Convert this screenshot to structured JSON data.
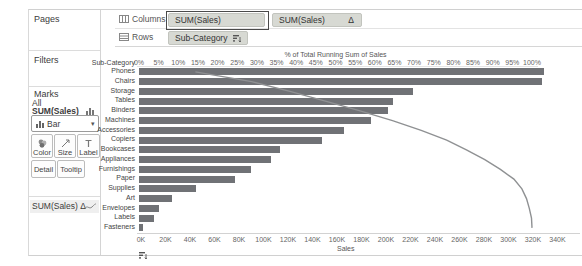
{
  "colors": {
    "bar": "#707276",
    "line": "#8f9193",
    "pill_bg": "#d7d9d3",
    "selected_pill_border": "#4a4a4a",
    "divider": "#d4d4d4"
  },
  "left_panel": {
    "pages_label": "Pages",
    "filters_label": "Filters",
    "marks_label": "Marks",
    "tab_all": "All",
    "tab_sales": "SUM(Sales)",
    "mark_type_label": "Bar",
    "color_label": "Color",
    "size_label": "Size",
    "label_label": "Label",
    "detail_label": "Detail",
    "tooltip_label": "Tooltip",
    "tab_sales_delta": "SUM(Sales) Δ"
  },
  "shelves": {
    "columns_label": "Columns",
    "rows_label": "Rows",
    "col_pill_1": "SUM(Sales)",
    "col_pill_2": "SUM(Sales)",
    "col_pill_2_suffix": "Δ",
    "row_pill_1": "Sub-Category"
  },
  "chart_data": {
    "type": "bar",
    "orientation": "horizontal",
    "top_axis_title": "% of Total Running Sum of Sales",
    "bottom_axis_title": "Sales",
    "row_header": "Sub-Category",
    "categories": [
      "Phones",
      "Chairs",
      "Storage",
      "Tables",
      "Binders",
      "Machines",
      "Accessories",
      "Copiers",
      "Bookcases",
      "Appliances",
      "Furnishings",
      "Paper",
      "Supplies",
      "Art",
      "Envelopes",
      "Labels",
      "Fasteners"
    ],
    "series": [
      {
        "name": "SUM(Sales)",
        "type": "bar",
        "axis": "bottom",
        "values": [
          330007,
          328449,
          223844,
          206966,
          203413,
          189239,
          167380,
          149528,
          114880,
          107532,
          91705,
          78479,
          46674,
          27119,
          16476,
          12486,
          3024
        ]
      },
      {
        "name": "SUM(Sales) Δ",
        "type": "line",
        "axis": "top",
        "values": [
          14.36,
          28.66,
          38.41,
          47.42,
          56.27,
          64.51,
          71.8,
          78.3,
          83.3,
          87.98,
          91.97,
          95.39,
          97.42,
          98.6,
          99.32,
          99.87,
          100.0
        ]
      }
    ],
    "bottom_axis": {
      "ticks": [
        "0K",
        "20K",
        "40K",
        "60K",
        "80K",
        "100K",
        "120K",
        "140K",
        "160K",
        "180K",
        "200K",
        "220K",
        "240K",
        "260K",
        "280K",
        "300K",
        "320K",
        "340K"
      ],
      "min": 0,
      "max": 340000,
      "tick_step": 20000
    },
    "top_axis": {
      "ticks": [
        "0%",
        "5%",
        "10%",
        "15%",
        "20%",
        "25%",
        "30%",
        "35%",
        "40%",
        "45%",
        "50%",
        "55%",
        "60%",
        "65%",
        "70%",
        "75%",
        "80%",
        "85%",
        "90%",
        "95%",
        "100%"
      ],
      "min_pct": 0,
      "max_pct": 100,
      "tick_step_pct": 5
    },
    "legend": "none",
    "grid": false
  }
}
